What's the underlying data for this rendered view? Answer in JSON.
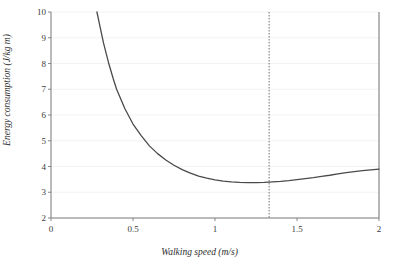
{
  "chart_data": {
    "type": "line",
    "title": "",
    "xlabel": "Walking speed (m/s)",
    "ylabel": "Energy consumption (J/kg m)",
    "xlim": [
      0,
      2
    ],
    "ylim": [
      2,
      10
    ],
    "grid": "horizontal",
    "legend": "none",
    "x_ticks": [
      "0",
      "0.5",
      "1",
      "1.5",
      "2"
    ],
    "x_tick_values": [
      0,
      0.5,
      1,
      1.5,
      2
    ],
    "y_ticks": [
      "2",
      "3",
      "4",
      "5",
      "6",
      "7",
      "8",
      "9",
      "10"
    ],
    "y_tick_values": [
      2,
      3,
      4,
      5,
      6,
      7,
      8,
      9,
      10
    ],
    "series": [
      {
        "name": "Energy consumption",
        "color": "#4a4a4a",
        "x": [
          0.28,
          0.3,
          0.32,
          0.35,
          0.38,
          0.4,
          0.45,
          0.5,
          0.55,
          0.6,
          0.65,
          0.7,
          0.75,
          0.8,
          0.85,
          0.9,
          0.95,
          1.0,
          1.05,
          1.1,
          1.15,
          1.2,
          1.25,
          1.3,
          1.33,
          1.4,
          1.45,
          1.5,
          1.55,
          1.6,
          1.65,
          1.7,
          1.75,
          1.8,
          1.85,
          1.9,
          1.95,
          2.0
        ],
        "y": [
          10.0,
          9.4,
          8.8,
          8.05,
          7.4,
          7.0,
          6.25,
          5.65,
          5.2,
          4.8,
          4.5,
          4.25,
          4.05,
          3.88,
          3.74,
          3.63,
          3.55,
          3.48,
          3.43,
          3.4,
          3.38,
          3.37,
          3.37,
          3.38,
          3.39,
          3.42,
          3.45,
          3.49,
          3.53,
          3.57,
          3.62,
          3.66,
          3.71,
          3.76,
          3.8,
          3.84,
          3.87,
          3.9
        ]
      }
    ],
    "annotations": [
      {
        "name": "optimal-speed-marker",
        "type": "vertical-dotted-line",
        "x": 1.33,
        "color": "#6e6e6e"
      },
      {
        "name": "right-boundary-line",
        "type": "vertical-solid-line",
        "x": 2.0,
        "color": "#6e6e6e"
      }
    ]
  },
  "axes": {
    "x_title": "Walking speed (m/s)",
    "y_title": "Energy consumption (J/kg m)"
  }
}
